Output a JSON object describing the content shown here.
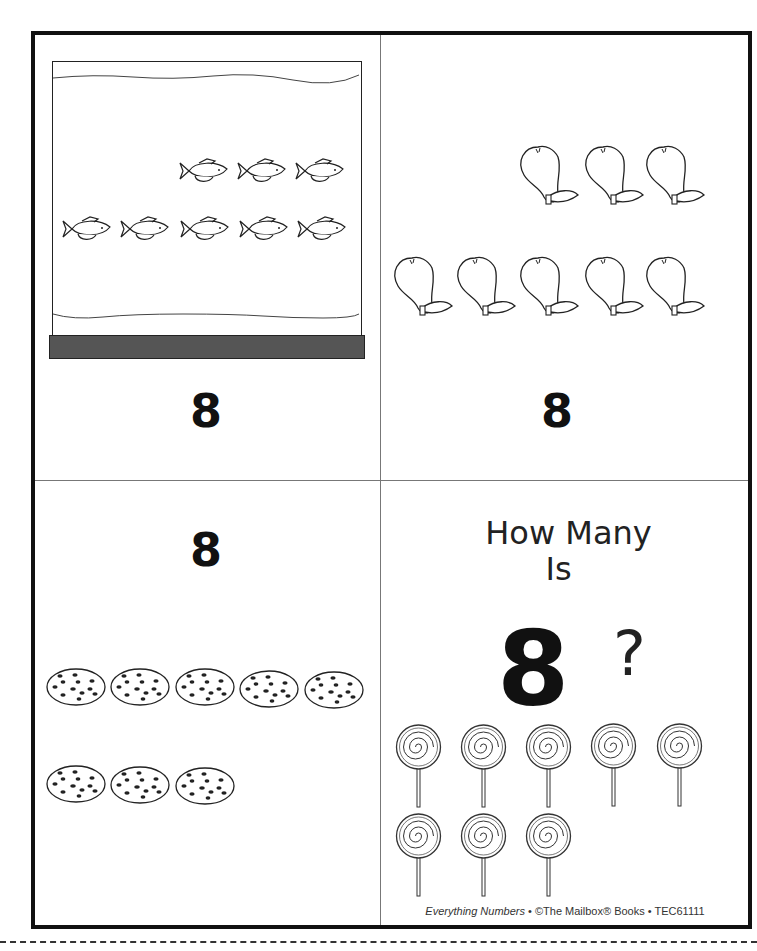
{
  "worksheet": {
    "cards": [
      {
        "name": "fish-tank-card",
        "item": "fish",
        "count": 8,
        "numeral": "8",
        "rows": [
          3,
          5
        ]
      },
      {
        "name": "pears-card",
        "item": "pear",
        "count": 8,
        "numeral": "8",
        "rows": [
          3,
          5
        ]
      },
      {
        "name": "cookies-card",
        "item": "cookie",
        "count": 8,
        "numeral": "8",
        "rows": [
          5,
          3
        ]
      },
      {
        "name": "title-card",
        "item": "lollipop",
        "count": 8,
        "rows": [
          5,
          3
        ],
        "title_line1": "How Many",
        "title_line2": "Is",
        "big_numeral": "8",
        "question_mark": "?"
      }
    ],
    "credit": {
      "book": "Everything Numbers",
      "separator": " • ",
      "publisher": "©The Mailbox® Books",
      "code": "TEC61111"
    }
  }
}
